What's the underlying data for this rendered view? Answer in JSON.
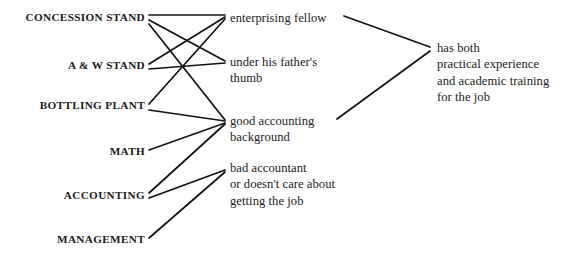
{
  "diagram": {
    "background_color": "#ffffff",
    "line_color": "#111111",
    "text_color": "#1a1a1a",
    "width": 587,
    "height": 259,
    "columns": {
      "evidence_label": "evidence",
      "inference_label": "inference",
      "conclusion_label": "conclusion"
    },
    "evidence": [
      {
        "id": "concession",
        "text": "CONCESSION STAND",
        "x": 145,
        "y": 18
      },
      {
        "id": "awstand",
        "text": "A & W STAND",
        "x": 145,
        "y": 66
      },
      {
        "id": "bottling",
        "text": "BOTTLING PLANT",
        "x": 145,
        "y": 106
      },
      {
        "id": "math",
        "text": "MATH",
        "x": 145,
        "y": 152
      },
      {
        "id": "accounting",
        "text": "ACCOUNTING",
        "x": 145,
        "y": 196
      },
      {
        "id": "management",
        "text": "MANAGEMENT",
        "x": 145,
        "y": 240
      }
    ],
    "inferences": [
      {
        "id": "enterprising",
        "lines": [
          "enterprising fellow"
        ],
        "x": 230,
        "y": 18
      },
      {
        "id": "father",
        "lines": [
          "under his father's",
          "thumb"
        ],
        "x": 230,
        "y": 62
      },
      {
        "id": "goodacct",
        "lines": [
          "good accounting",
          "background"
        ],
        "x": 230,
        "y": 121
      },
      {
        "id": "badacct",
        "lines": [
          "bad accountant",
          "or doesn't care about",
          "getting the job"
        ],
        "x": 230,
        "y": 168
      }
    ],
    "conclusions": [
      {
        "id": "hasboth",
        "lines": [
          "has both",
          "practical experience",
          "and academic training",
          "for the job"
        ],
        "x": 437,
        "y": 48
      }
    ],
    "edges": [
      {
        "id": "e1",
        "from": "concession",
        "to": "enterprising",
        "x1": 149,
        "y1": 15,
        "x2": 225,
        "y2": 15
      },
      {
        "id": "e2",
        "from": "concession",
        "to": "father",
        "x1": 149,
        "y1": 20,
        "x2": 225,
        "y2": 61
      },
      {
        "id": "e3",
        "from": "concession",
        "to": "goodacct",
        "x1": 149,
        "y1": 24,
        "x2": 225,
        "y2": 120
      },
      {
        "id": "e4",
        "from": "awstand",
        "to": "enterprising",
        "x1": 149,
        "y1": 64,
        "x2": 225,
        "y2": 17
      },
      {
        "id": "e5",
        "from": "awstand",
        "to": "father",
        "x1": 149,
        "y1": 69,
        "x2": 225,
        "y2": 63
      },
      {
        "id": "e6",
        "from": "bottling",
        "to": "enterprising",
        "x1": 149,
        "y1": 104,
        "x2": 225,
        "y2": 19
      },
      {
        "id": "e7",
        "from": "bottling",
        "to": "goodacct",
        "x1": 149,
        "y1": 110,
        "x2": 225,
        "y2": 121
      },
      {
        "id": "e8",
        "from": "math",
        "to": "goodacct",
        "x1": 149,
        "y1": 150,
        "x2": 225,
        "y2": 123
      },
      {
        "id": "e9",
        "from": "accounting",
        "to": "goodacct",
        "x1": 149,
        "y1": 193,
        "x2": 225,
        "y2": 124
      },
      {
        "id": "e10",
        "from": "accounting",
        "to": "badacct",
        "x1": 149,
        "y1": 198,
        "x2": 225,
        "y2": 170
      },
      {
        "id": "e11",
        "from": "management",
        "to": "badacct",
        "x1": 149,
        "y1": 238,
        "x2": 225,
        "y2": 172
      },
      {
        "id": "e12",
        "from": "enterprising",
        "to": "hasboth",
        "x1": 344,
        "y1": 16,
        "x2": 430,
        "y2": 47
      },
      {
        "id": "e13",
        "from": "goodacct",
        "to": "hasboth",
        "x1": 337,
        "y1": 119,
        "x2": 430,
        "y2": 51
      }
    ]
  }
}
